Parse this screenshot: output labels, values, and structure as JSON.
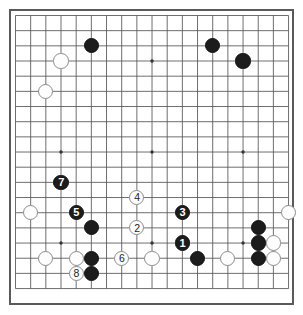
{
  "app": {
    "title": "Go Board Diagram",
    "board_type": "go-board",
    "size": 19,
    "background_color": "#ffffff",
    "line_color": "#555555",
    "border_color": "#5a5a5a",
    "black_color": "#1c1c1c",
    "white_color": "#fdfdfd"
  },
  "board": {
    "columns": 19,
    "rows": 19,
    "origin_x": 15.5,
    "origin_y": 15.5,
    "spacing": 15.17,
    "stone_radius": 7.6,
    "star_points": [
      {
        "col": 4,
        "row": 4
      },
      {
        "col": 10,
        "row": 4
      },
      {
        "col": 16,
        "row": 4
      },
      {
        "col": 4,
        "row": 10
      },
      {
        "col": 10,
        "row": 10
      },
      {
        "col": 16,
        "row": 10
      },
      {
        "col": 4,
        "row": 16
      },
      {
        "col": 10,
        "row": 16
      },
      {
        "col": 16,
        "row": 16
      }
    ]
  },
  "stones": [
    {
      "col": 6,
      "row": 3,
      "color": "black",
      "label": ""
    },
    {
      "col": 14,
      "row": 3,
      "color": "black",
      "label": ""
    },
    {
      "col": 16,
      "row": 4,
      "color": "black",
      "label": ""
    },
    {
      "col": 4,
      "row": 4,
      "color": "white",
      "label": ""
    },
    {
      "col": 3,
      "row": 6,
      "color": "white",
      "label": ""
    },
    {
      "col": 4,
      "row": 12,
      "color": "black",
      "label": "7"
    },
    {
      "col": 5,
      "row": 14,
      "color": "black",
      "label": "5"
    },
    {
      "col": 2,
      "row": 14,
      "color": "white",
      "label": ""
    },
    {
      "col": 19,
      "row": 14,
      "color": "white",
      "label": ""
    },
    {
      "col": 9,
      "row": 13,
      "color": "white",
      "label": "4"
    },
    {
      "col": 12,
      "row": 14,
      "color": "black",
      "label": "3"
    },
    {
      "col": 6,
      "row": 15,
      "color": "black",
      "label": ""
    },
    {
      "col": 9,
      "row": 15,
      "color": "white",
      "label": "2"
    },
    {
      "col": 17,
      "row": 15,
      "color": "black",
      "label": ""
    },
    {
      "col": 3,
      "row": 17,
      "color": "white",
      "label": ""
    },
    {
      "col": 12,
      "row": 16,
      "color": "black",
      "label": "1"
    },
    {
      "col": 17,
      "row": 16,
      "color": "black",
      "label": ""
    },
    {
      "col": 18,
      "row": 16,
      "color": "white",
      "label": ""
    },
    {
      "col": 5,
      "row": 17,
      "color": "white",
      "label": ""
    },
    {
      "col": 6,
      "row": 17,
      "color": "black",
      "label": ""
    },
    {
      "col": 8,
      "row": 17,
      "color": "white",
      "label": "6"
    },
    {
      "col": 10,
      "row": 17,
      "color": "white",
      "label": ""
    },
    {
      "col": 13,
      "row": 17,
      "color": "black",
      "label": ""
    },
    {
      "col": 15,
      "row": 17,
      "color": "white",
      "label": ""
    },
    {
      "col": 17,
      "row": 17,
      "color": "black",
      "label": ""
    },
    {
      "col": 18,
      "row": 17,
      "color": "white",
      "label": ""
    },
    {
      "col": 5,
      "row": 18,
      "color": "white",
      "label": "8"
    },
    {
      "col": 6,
      "row": 18,
      "color": "black",
      "label": ""
    }
  ]
}
